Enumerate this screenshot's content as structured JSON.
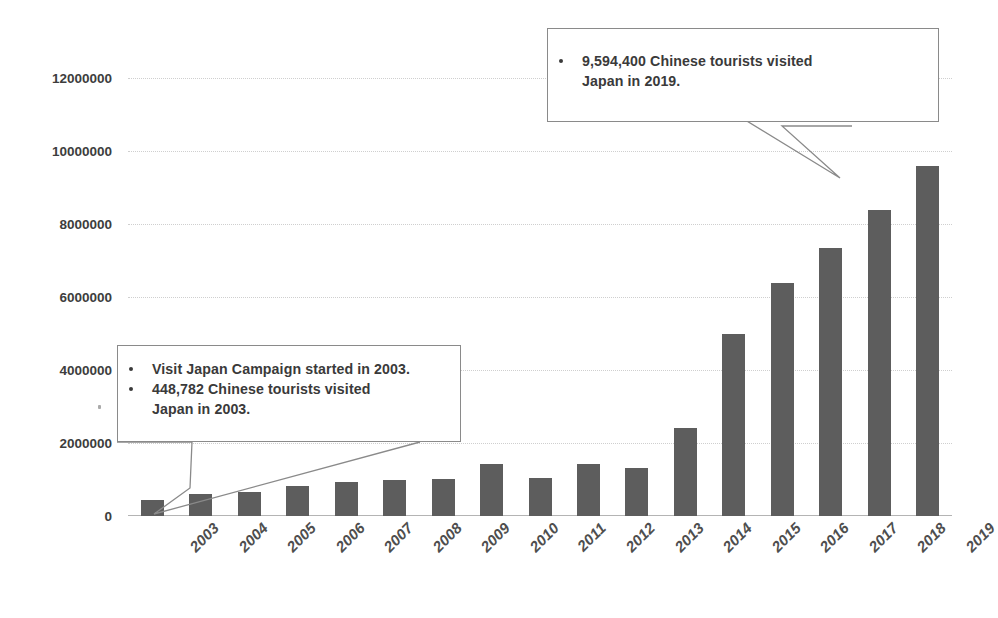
{
  "chart_data": {
    "type": "bar",
    "title": "",
    "subtitle": "",
    "xlabel": "",
    "ylabel": "",
    "categories": [
      "2003",
      "2004",
      "2005",
      "2006",
      "2007",
      "2008",
      "2009",
      "2010",
      "2011",
      "2012",
      "2013",
      "2014",
      "2015",
      "2016",
      "2017",
      "2018",
      "2019"
    ],
    "values": [
      448782,
      616000,
      653000,
      812000,
      942000,
      1000000,
      1006000,
      1413000,
      1043000,
      1425000,
      1314000,
      2409000,
      4994000,
      6373000,
      7356000,
      8380000,
      9594400
    ],
    "ylim": [
      0,
      12000000
    ],
    "ytick_labels": [
      "0",
      "2000000",
      "4000000",
      "6000000",
      "8000000",
      "10000000",
      "12000000"
    ],
    "ytick_values": [
      0,
      2000000,
      4000000,
      6000000,
      8000000,
      10000000,
      12000000
    ],
    "grid": true,
    "legend": "none",
    "series_color": "#5d5d5d",
    "gridline_color": "#cfcfcf",
    "annotations": [
      {
        "id": "callout-2003",
        "points_to": "2003",
        "lines": [
          "Visit Japan Campaign started in 2003.",
          "448,782 Chinese tourists visited",
          "Japan in 2003."
        ]
      },
      {
        "id": "callout-2019",
        "points_to": "2019",
        "lines": [
          "9,594,400 Chinese tourists visited",
          "Japan in 2019."
        ]
      }
    ]
  }
}
